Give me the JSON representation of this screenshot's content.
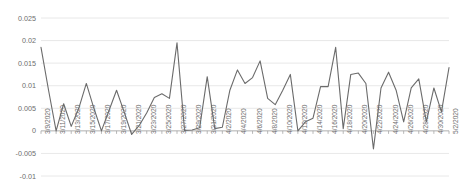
{
  "chart_data": {
    "type": "line",
    "title": "",
    "subtitle": "",
    "xlabel": "",
    "ylabel": "",
    "ylim": [
      -0.01,
      0.025
    ],
    "yticks": [
      0.025,
      0.02,
      0.015,
      0.01,
      0.005,
      0,
      -0.005,
      -0.01
    ],
    "ytick_labels": [
      "0.025",
      "0.02",
      "0.015",
      "0.01",
      "0.005",
      "0",
      "-0.005",
      "-0.01"
    ],
    "grid": true,
    "grid_axis": "y",
    "legend": "none",
    "line_color": "#6b6b6b",
    "grid_color": "#e2e2e2",
    "axis_color": "#a6a6a6",
    "tick_label_color": "#6d6d6d",
    "xtick_labels": [
      "3/9/2020",
      "3/11/2020",
      "3/13/2020",
      "3/15/2020",
      "3/17/2020",
      "3/19/2020",
      "3/21/2020",
      "3/23/2020",
      "3/25/2020",
      "3/27/2020",
      "3/29/2020",
      "3/31/2020",
      "4/2/2020",
      "4/4/2020",
      "4/6/2020",
      "4/8/2020",
      "4/10/2020",
      "4/12/2020",
      "4/14/2020",
      "4/16/2020",
      "4/18/2020",
      "4/20/2020",
      "4/22/2020",
      "4/24/2020",
      "4/26/2020",
      "4/28/2020",
      "4/30/2020",
      "5/2/2020"
    ],
    "x": [
      "3/9/2020",
      "3/10/2020",
      "3/11/2020",
      "3/12/2020",
      "3/13/2020",
      "3/14/2020",
      "3/15/2020",
      "3/16/2020",
      "3/17/2020",
      "3/18/2020",
      "3/19/2020",
      "3/20/2020",
      "3/21/2020",
      "3/22/2020",
      "3/23/2020",
      "3/24/2020",
      "3/25/2020",
      "3/26/2020",
      "3/27/2020",
      "3/28/2020",
      "3/29/2020",
      "3/30/2020",
      "3/31/2020",
      "4/1/2020",
      "4/2/2020",
      "4/3/2020",
      "4/4/2020",
      "4/5/2020",
      "4/6/2020",
      "4/7/2020",
      "4/8/2020",
      "4/9/2020",
      "4/10/2020",
      "4/11/2020",
      "4/12/2020",
      "4/13/2020",
      "4/14/2020",
      "4/15/2020",
      "4/16/2020",
      "4/17/2020",
      "4/18/2020",
      "4/19/2020",
      "4/20/2020",
      "4/21/2020",
      "4/22/2020",
      "4/23/2020",
      "4/24/2020",
      "4/25/2020",
      "4/26/2020",
      "4/27/2020",
      "4/28/2020",
      "4/29/2020",
      "4/30/2020",
      "5/1/2020",
      "5/2/2020"
    ],
    "values": [
      0.0185,
      0.009,
      0.0,
      0.006,
      0.001,
      0.005,
      0.0105,
      0.005,
      0.0,
      0.0045,
      0.009,
      0.0042,
      -0.0008,
      0.0012,
      0.004,
      0.0074,
      0.0082,
      0.0072,
      0.0195,
      0.0001,
      0.0002,
      0.0007,
      0.012,
      0.0005,
      0.0008,
      0.009,
      0.0135,
      0.0105,
      0.0118,
      0.0155,
      0.0072,
      0.0058,
      0.009,
      0.0125,
      0.0,
      0.002,
      0.0028,
      0.0098,
      0.0098,
      0.0185,
      0.0005,
      0.0125,
      0.0128,
      0.0105,
      -0.004,
      0.0095,
      0.013,
      0.009,
      0.002,
      0.0095,
      0.0115,
      0.002,
      0.0095,
      0.0042,
      0.014
    ],
    "series": [
      {
        "name": "series-1",
        "color": "#6b6b6b",
        "values": [
          0.0185,
          0.009,
          0.0,
          0.006,
          0.001,
          0.005,
          0.0105,
          0.005,
          0.0,
          0.0045,
          0.009,
          0.0042,
          -0.0008,
          0.0012,
          0.004,
          0.0074,
          0.0082,
          0.0072,
          0.0195,
          0.0001,
          0.0002,
          0.0007,
          0.012,
          0.0005,
          0.0008,
          0.009,
          0.0135,
          0.0105,
          0.0118,
          0.0155,
          0.0072,
          0.0058,
          0.009,
          0.0125,
          0.0,
          0.002,
          0.0028,
          0.0098,
          0.0098,
          0.0185,
          0.0005,
          0.0125,
          0.0128,
          0.0105,
          -0.004,
          0.0095,
          0.013,
          0.009,
          0.002,
          0.0095,
          0.0115,
          0.002,
          0.0095,
          0.0042,
          0.014
        ]
      }
    ]
  },
  "layout": {
    "plot_left": 41,
    "plot_right": 449,
    "plot_top": 18,
    "plot_bottom": 176,
    "xlabel_top": 134
  }
}
